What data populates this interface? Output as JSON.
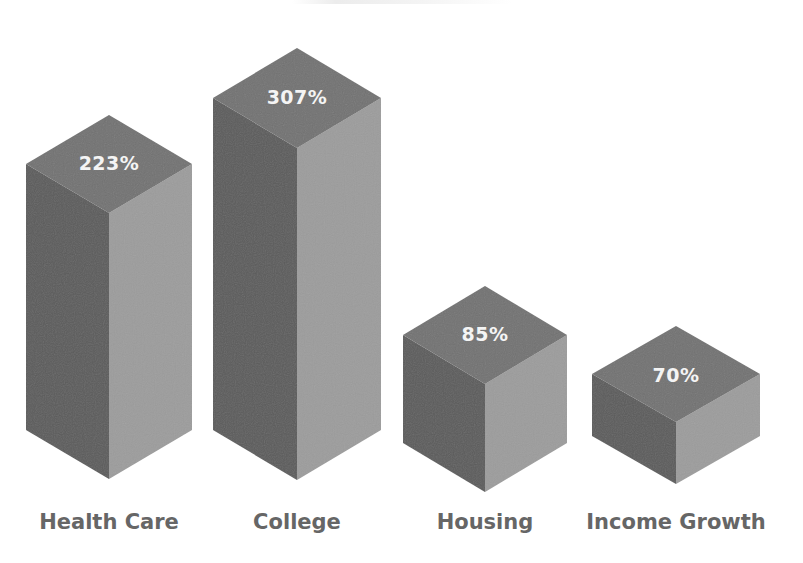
{
  "chart_data": {
    "type": "bar",
    "style": "3d-isometric-boxes",
    "title": "",
    "title_note": "Title text is clipped at the top edge and not legible",
    "categories": [
      "Health Care",
      "College",
      "Housing",
      "Income Growth"
    ],
    "values": [
      223,
      307,
      85,
      70
    ],
    "value_labels": [
      "223%",
      "307%",
      "85%",
      "70%"
    ],
    "unit": "%",
    "xlabel": "",
    "ylabel": "",
    "grid": false,
    "legend": null,
    "colors": {
      "top_face": "#727272",
      "left_face": "#5c5c5c",
      "right_face": "#9c9c9c",
      "value_text": "#f4f4f4",
      "category_text": "#666666"
    }
  },
  "geometry": {
    "bars": [
      {
        "cx": 109,
        "apex_y": 115,
        "half_w": 83,
        "face_h": 49,
        "bottom_y": 479,
        "label_y": 170,
        "cat_y": 529
      },
      {
        "cx": 297,
        "apex_y": 48,
        "half_w": 84,
        "face_h": 50,
        "bottom_y": 480,
        "label_y": 104,
        "cat_y": 529
      },
      {
        "cx": 485,
        "apex_y": 286,
        "half_w": 82,
        "face_h": 49,
        "bottom_y": 492,
        "label_y": 341,
        "cat_y": 529
      },
      {
        "cx": 676,
        "apex_y": 326,
        "half_w": 84,
        "face_h": 48,
        "bottom_y": 484,
        "label_y": 382,
        "cat_y": 529
      }
    ]
  }
}
